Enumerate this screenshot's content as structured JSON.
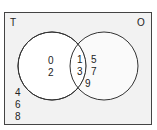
{
  "diagram": {
    "type": "venn",
    "universal_label": "T",
    "right_set_label": "O",
    "left_only": [
      "0",
      "2"
    ],
    "intersection": [
      "1",
      "3"
    ],
    "right_only": [
      "5",
      "7",
      "9"
    ],
    "outside": [
      "4",
      "6",
      "8"
    ],
    "colors": {
      "box_fill": "#f2f2f2",
      "circle_fill": "#ffffff",
      "stroke": "#333333"
    }
  }
}
